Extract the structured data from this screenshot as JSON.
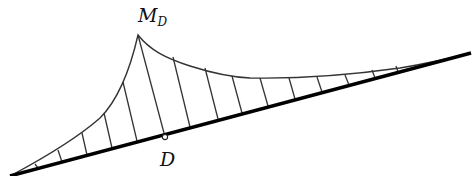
{
  "diagram": {
    "type": "bending-moment-influence-diagram",
    "labels": {
      "peak_main": "M",
      "peak_sub": "D",
      "point": "D"
    },
    "colors": {
      "stroke": "#111111",
      "background": "#ffffff"
    },
    "baseline": {
      "start": [
        12,
        175
      ],
      "end": [
        470,
        53
      ]
    },
    "peak": [
      138,
      35
    ],
    "point_D": [
      164,
      135
    ]
  }
}
